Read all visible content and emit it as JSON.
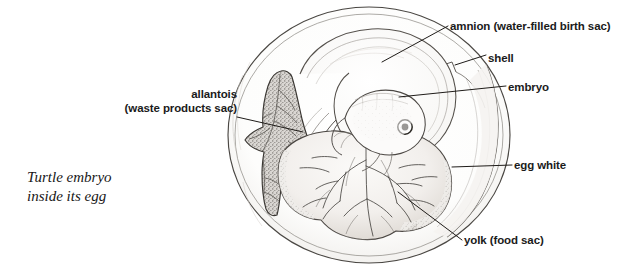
{
  "figure": {
    "caption_line1": "Turtle embryo",
    "caption_line2": "inside its egg",
    "background_color": "#ffffff",
    "ink_color": "#1b1b1b",
    "labels": {
      "allantois_line1": "allantois",
      "allantois_line2": "(waste products sac)",
      "amnion": "amnion (water-filled birth sac)",
      "shell": "shell",
      "embryo": "embryo",
      "egg_white": "egg white",
      "yolk": "yolk (food sac)"
    },
    "parts": [
      "shell",
      "egg white",
      "amnion",
      "embryo",
      "allantois",
      "yolk"
    ]
  }
}
